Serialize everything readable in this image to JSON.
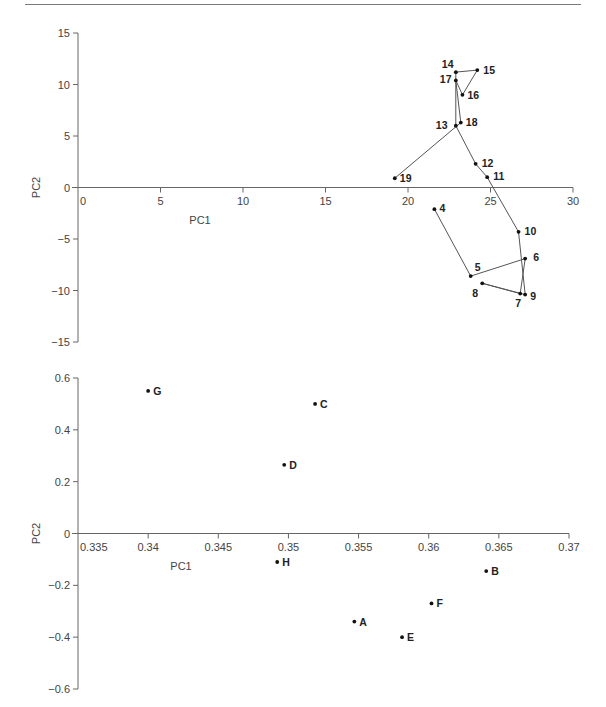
{
  "chart_data": [
    {
      "type": "line",
      "title": "",
      "xlabel": "PC1",
      "ylabel": "PC2",
      "xlim": [
        0,
        30
      ],
      "ylim": [
        -15,
        15
      ],
      "x_ticks": [
        "0",
        "5",
        "10",
        "15",
        "20",
        "25",
        "30"
      ],
      "y_ticks": [
        "15",
        "10",
        "5",
        "0",
        "-5",
        "-10",
        "-15"
      ],
      "grid": false,
      "legend": null,
      "markers": true,
      "connected_in_order": true,
      "points": [
        {
          "label": "4",
          "x": 21.6,
          "y": -2.1
        },
        {
          "label": "5",
          "x": 23.8,
          "y": -8.6
        },
        {
          "label": "6",
          "x": 27.1,
          "y": -6.9
        },
        {
          "label": "7",
          "x": 26.8,
          "y": -10.3
        },
        {
          "label": "8",
          "x": 24.5,
          "y": -9.3
        },
        {
          "label": "9",
          "x": 27.1,
          "y": -10.4
        },
        {
          "label": "10",
          "x": 26.7,
          "y": -4.3
        },
        {
          "label": "11",
          "x": 24.8,
          "y": 1.0
        },
        {
          "label": "12",
          "x": 24.1,
          "y": 2.3
        },
        {
          "label": "13",
          "x": 22.9,
          "y": 6.0
        },
        {
          "label": "14",
          "x": 22.9,
          "y": 11.2
        },
        {
          "label": "15",
          "x": 24.2,
          "y": 11.4
        },
        {
          "label": "16",
          "x": 23.3,
          "y": 9.0
        },
        {
          "label": "17",
          "x": 22.9,
          "y": 10.4
        },
        {
          "label": "18",
          "x": 23.2,
          "y": 6.3
        },
        {
          "label": "19",
          "x": 19.2,
          "y": 0.9
        }
      ]
    },
    {
      "type": "scatter",
      "title": "",
      "xlabel": "PC1",
      "ylabel": "PC2",
      "xlim": [
        0.335,
        0.37
      ],
      "ylim": [
        -0.6,
        0.6
      ],
      "x_ticks": [
        "0.335",
        "0.34",
        "0.345",
        "0.35",
        "0.355",
        "0.36",
        "0.365",
        "0.37"
      ],
      "y_ticks": [
        "0.6",
        "0.4",
        "0.2",
        "0",
        "-0.2",
        "-0.4",
        "-0.6"
      ],
      "grid": false,
      "legend": null,
      "points": [
        {
          "label": "G",
          "x": 0.34,
          "y": 0.55
        },
        {
          "label": "C",
          "x": 0.3519,
          "y": 0.5
        },
        {
          "label": "D",
          "x": 0.3497,
          "y": 0.265
        },
        {
          "label": "H",
          "x": 0.3492,
          "y": -0.11
        },
        {
          "label": "B",
          "x": 0.3641,
          "y": -0.145
        },
        {
          "label": "F",
          "x": 0.3602,
          "y": -0.27
        },
        {
          "label": "A",
          "x": 0.3547,
          "y": -0.34
        },
        {
          "label": "E",
          "x": 0.3581,
          "y": -0.4
        }
      ]
    }
  ]
}
